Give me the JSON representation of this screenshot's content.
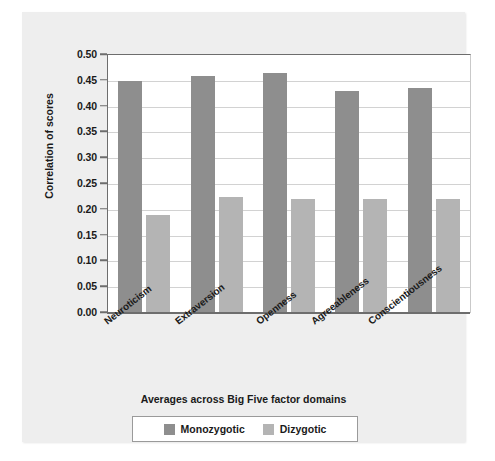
{
  "chart_data": {
    "type": "bar",
    "title": "",
    "xlabel": "Averages across Big Five factor domains",
    "ylabel": "Correlation of scores",
    "categories": [
      "Neuroticism",
      "Extraversion",
      "Openness",
      "Agreeableness",
      "Conscientiousness"
    ],
    "series": [
      {
        "name": "Monozygotic",
        "color": "#8e8e8e",
        "values": [
          0.45,
          0.46,
          0.465,
          0.43,
          0.437
        ]
      },
      {
        "name": "Dizygotic",
        "color": "#b4b4b4",
        "values": [
          0.19,
          0.225,
          0.22,
          0.22,
          0.22
        ]
      }
    ],
    "ylim": [
      0.0,
      0.5
    ],
    "ytick_step": 0.05,
    "yticks": [
      "0.00",
      "0.05",
      "0.10",
      "0.15",
      "0.20",
      "0.25",
      "0.30",
      "0.35",
      "0.40",
      "0.45",
      "0.50"
    ],
    "grid": true,
    "grid_axis": "y",
    "legend_position": "bottom-center"
  },
  "legend": {
    "entries": [
      {
        "label": "Monozygotic"
      },
      {
        "label": "Dizygotic"
      }
    ]
  }
}
